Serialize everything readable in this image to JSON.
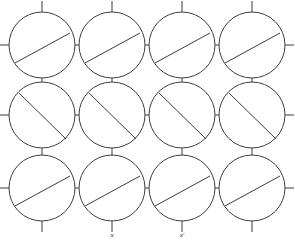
{
  "figure": {
    "width": 295,
    "height": 242,
    "background_color": "#ffffff",
    "line_color": "#3b3b42",
    "label_color": "#1d1d20"
  },
  "lattice": {
    "columns": 4,
    "rows": 3,
    "column_centers": [
      42,
      112,
      182,
      252
    ],
    "row_centers": [
      45,
      115,
      188
    ],
    "radius": 33,
    "stub_length": 11,
    "link_gap": 4
  },
  "chords": {
    "shallow_rows": [
      0,
      2
    ],
    "steep_rows": [
      1
    ],
    "shallow_angle_deg": 28,
    "shallow_offset": 9,
    "steep_angle_deg": 45,
    "steep_offset": 2
  },
  "labels": [
    {
      "id": "label-x",
      "text": "x",
      "column": 1,
      "x": 112,
      "y": 237
    },
    {
      "id": "label-x-prime",
      "text": "x′",
      "column": 2,
      "x": 182,
      "y": 237
    }
  ]
}
